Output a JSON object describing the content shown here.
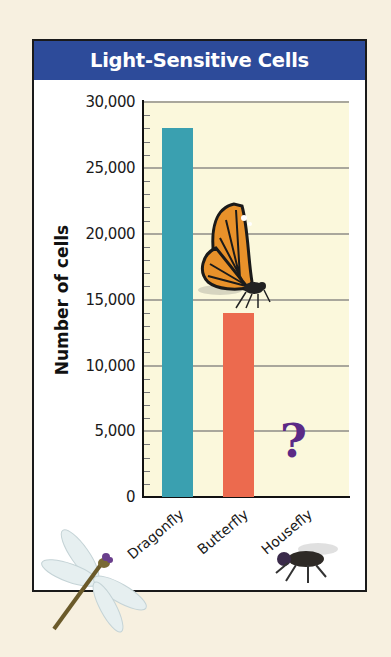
{
  "chart_data": {
    "type": "bar",
    "title": "Light-Sensitive Cells",
    "xlabel": "",
    "ylabel": "Number of cells",
    "categories": [
      "Dragonfly",
      "Butterfly",
      "Housefly"
    ],
    "values": [
      28000,
      14000,
      null
    ],
    "unknown_marker": {
      "category": "Housefly",
      "symbol": "?"
    },
    "ylim": [
      0,
      30000
    ],
    "yticks": [
      "0",
      "5,000",
      "10,000",
      "15,000",
      "20,000",
      "25,000",
      "30,000"
    ],
    "minor_tick_step": 1000,
    "grid": true,
    "bar_colors": {
      "Dragonfly": "#3aa0b0",
      "Butterfly": "#ec6a4e"
    },
    "plot_background": "#fbf8dc",
    "title_background": "#2d4b9a",
    "illustrations": [
      "dragonfly",
      "monarch butterfly",
      "housefly"
    ]
  }
}
